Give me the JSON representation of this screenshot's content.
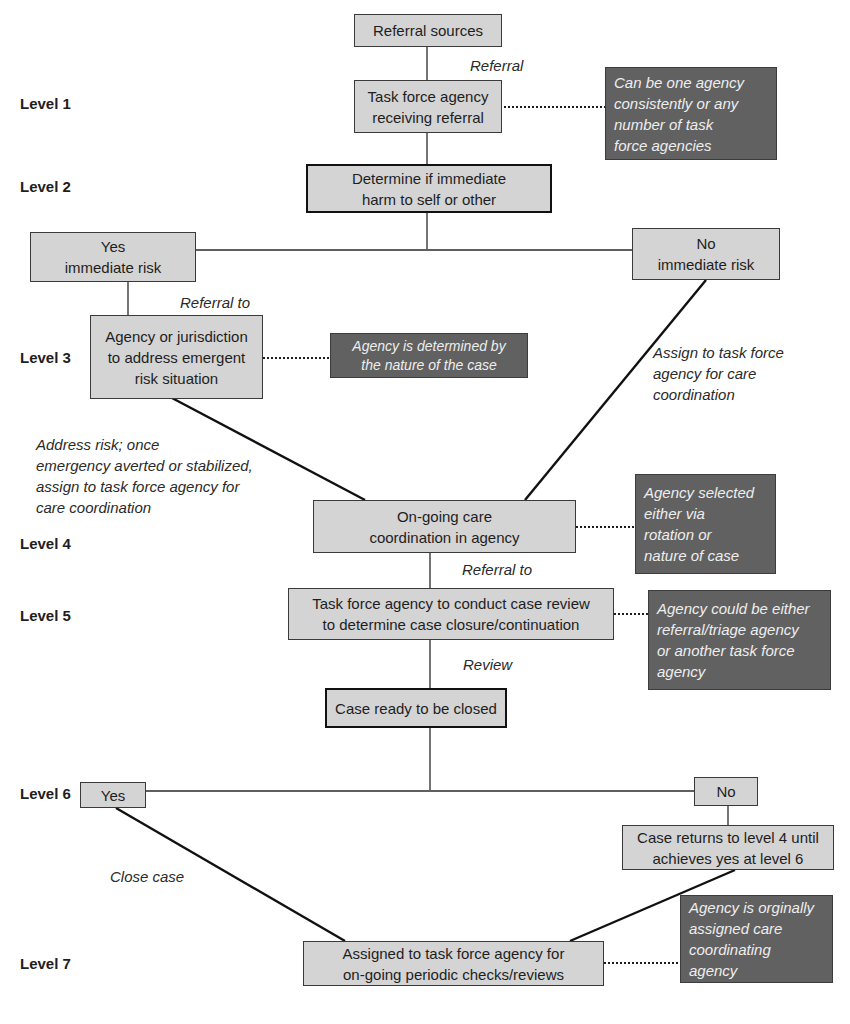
{
  "levels": [
    "Level 1",
    "Level 2",
    "Level 3",
    "Level 4",
    "Level 5",
    "Level 6",
    "Level 7"
  ],
  "nodes": {
    "referral_sources": "Referral sources",
    "task_force_receiving": "Task force agency\nreceiving referral",
    "determine_harm": "Determine if immediate\nharm to self or other",
    "yes_immediate": "Yes\nimmediate risk",
    "no_immediate": "No\nimmediate risk",
    "agency_jurisdiction": "Agency or jurisdiction\nto address emergent\nrisk situation",
    "ongoing_care": "On-going care\ncoordination in agency",
    "case_review": "Task force agency to conduct case review\nto determine case closure/continuation",
    "case_ready": "Case ready to be closed",
    "yes_l6": "Yes",
    "no_l6": "No",
    "case_returns": "Case returns to level 4 until\nachieves yes at level 6",
    "assigned_periodic": "Assigned to task force agency for\non-going periodic checks/reviews"
  },
  "notes": {
    "l1": "Can be one agency\nconsistently or any\nnumber of task\nforce agencies",
    "l3": "Agency is determined by\nthe nature of the case",
    "l4": "Agency selected\neither via\nrotation or\nnature of case",
    "l5": "Agency could be either\nreferral/triage agency\nor another task force\nagency",
    "l7": "Agency is orginally\nassigned care\ncoordinating\nagency"
  },
  "edge_labels": {
    "referral": "Referral",
    "referral_to_l3": "Referral to",
    "assign_care": "Assign to task force\nagency for care\ncoordination",
    "address_risk": "Address risk; once\nemergency averted or stabilized,\nassign to task force agency for\ncare coordination",
    "referral_to_l5": "Referral to",
    "review": "Review",
    "close_case": "Close case"
  },
  "colors": {
    "box_fill": "#d4d4d4",
    "note_fill": "#616161",
    "note_text": "#eeeeee",
    "line": "#1e1e1e"
  }
}
